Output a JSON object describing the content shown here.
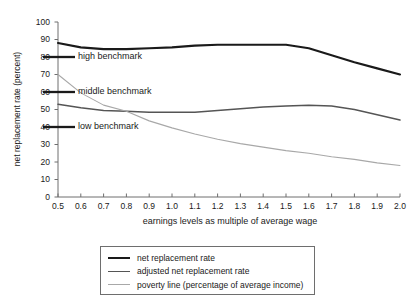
{
  "chart_data": {
    "type": "line",
    "title": "",
    "xlabel": "earnings levels as multiple of average wage",
    "ylabel": "net replacement rate (percent)",
    "xlim": [
      0.5,
      2.0
    ],
    "ylim": [
      0,
      100
    ],
    "grid": false,
    "legend_position": "bottom",
    "x": [
      0.5,
      0.6,
      0.7,
      0.8,
      0.9,
      1.0,
      1.1,
      1.2,
      1.3,
      1.4,
      1.5,
      1.6,
      1.7,
      1.8,
      1.9,
      2.0
    ],
    "xtick_labels": [
      "0.5",
      "0.6",
      "0.7",
      "0.8",
      "0.9",
      "1.0",
      "1.1",
      "1.2",
      "1.3",
      "1.4",
      "1.5",
      "1.6",
      "1.7",
      "1.8",
      "1.9",
      "2.0"
    ],
    "ytick_labels": [
      "0",
      "10",
      "20",
      "30",
      "40",
      "50",
      "60",
      "70",
      "80",
      "90",
      "100"
    ],
    "ytick_values": [
      0,
      10,
      20,
      30,
      40,
      50,
      60,
      70,
      80,
      90,
      100
    ],
    "series": [
      {
        "name": "net replacement rate",
        "color": "#1a1a1a",
        "width": 2.1,
        "values": [
          88,
          85.5,
          84.5,
          84.5,
          85,
          85.5,
          86.5,
          87,
          87,
          87,
          87,
          85,
          81,
          77,
          73.5,
          70
        ]
      },
      {
        "name": "adjusted net replacement rate",
        "color": "#555555",
        "width": 1.5,
        "values": [
          53,
          51,
          49.5,
          49,
          48.5,
          48.5,
          48.5,
          49.5,
          50.5,
          51.5,
          52,
          52.5,
          52,
          50,
          47,
          44
        ]
      },
      {
        "name": "poverty line (percentage of average income)",
        "color": "#a8a8a8",
        "width": 1.1,
        "values": [
          70,
          59.5,
          52.5,
          49,
          43.5,
          39.5,
          36,
          33,
          30.5,
          28.5,
          26.5,
          25,
          23,
          21.5,
          19.5,
          18
        ]
      }
    ],
    "annotations": [
      {
        "label": "high benchmark",
        "value": 80
      },
      {
        "label": "middle benchmark",
        "value": 60
      },
      {
        "label": "low benchmark",
        "value": 40
      }
    ],
    "axis_color": "#6e6e6e",
    "annotation_color": "#1a1a1a"
  },
  "legend": {
    "items": [
      "net replacement rate",
      "adjusted net replacement rate",
      "poverty line (percentage of average income)"
    ]
  }
}
